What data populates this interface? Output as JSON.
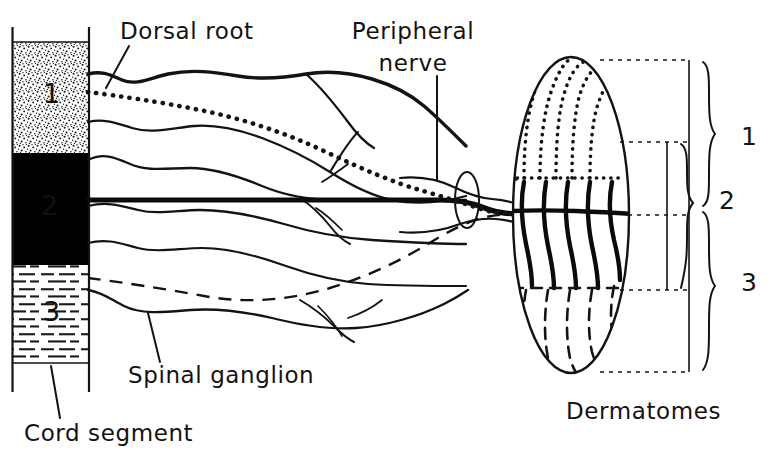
{
  "figure": {
    "type": "anatomical-diagram",
    "labels": {
      "dorsal_root": "Dorsal root",
      "peripheral_nerve_line1": "Peripheral",
      "peripheral_nerve_line2": "nerve",
      "spinal_ganglion": "Spinal ganglion",
      "cord_segment": "Cord segment",
      "dermatomes": "Dermatomes"
    },
    "cord_segments": [
      {
        "number": "1",
        "fill_style": "stipple",
        "number_color": "#111111"
      },
      {
        "number": "2",
        "fill_style": "solid-black",
        "number_color": "#111111"
      },
      {
        "number": "3",
        "fill_style": "horizontal-dashes",
        "number_color": "#111111"
      }
    ],
    "dermatome_zones": [
      {
        "number": "1",
        "line_style": "dotted"
      },
      {
        "number": "2",
        "line_style": "solid"
      },
      {
        "number": "3",
        "line_style": "dashed"
      }
    ],
    "bracket_labels": {
      "zone1": "1",
      "zone2": "2",
      "zone3": "3"
    },
    "colors": {
      "ink": "#16120f",
      "paper": "#ffffff",
      "segment2_fill": "#000000"
    }
  }
}
